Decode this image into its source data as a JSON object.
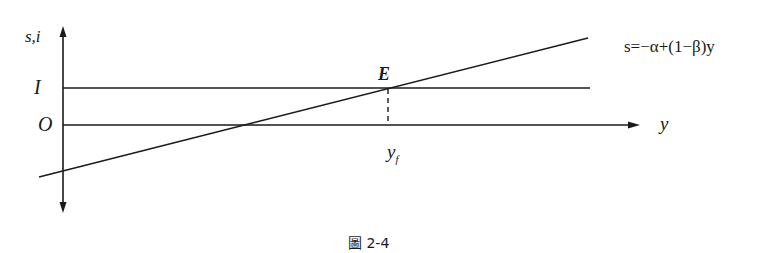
{
  "figure": {
    "caption": "圖 2-4",
    "axes": {
      "y_label": "s,i",
      "x_label": "y",
      "origin_label": "O"
    },
    "lines": {
      "investment_label": "I",
      "saving_equation": "s=−α+(1−β)y"
    },
    "equilibrium": {
      "point_label": "E",
      "x_label": "y",
      "x_label_subscript": "f"
    },
    "colors": {
      "stroke": "#1a1a1a",
      "background": "#ffffff"
    }
  }
}
